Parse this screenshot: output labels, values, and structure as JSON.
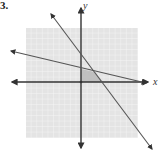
{
  "problem": {
    "number_label": "3."
  },
  "graph": {
    "x_axis_label": "x",
    "y_axis_label": "y",
    "grid": {
      "x_min": -10,
      "x_max": 10,
      "y_min": -10,
      "y_max": 10,
      "step": 1
    },
    "colors": {
      "grid_bg": "#e4e4e4",
      "grid_line": "#f7f7f7",
      "axis": "#333333",
      "line": "#555555",
      "shaded_region": "#b8b8b8"
    },
    "lines": [
      {
        "name": "steep-line",
        "y_intercept": 5,
        "x_intercept": 4
      },
      {
        "name": "shallow-line",
        "y_intercept": 2.3,
        "x_intercept": 11.5
      }
    ],
    "feasible_region_vertices": [
      [
        0,
        0
      ],
      [
        0,
        2.3
      ],
      [
        2.5,
        1.8
      ],
      [
        4,
        0
      ]
    ]
  }
}
